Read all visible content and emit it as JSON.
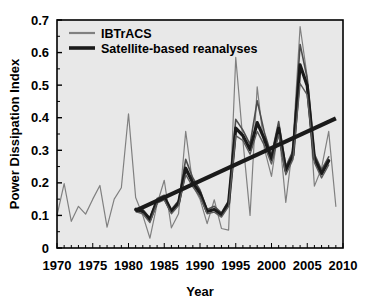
{
  "chart_data": {
    "type": "line",
    "title": "",
    "xlabel": "Year",
    "ylabel": "Power Dissipation Index",
    "xlim": [
      1970,
      2010
    ],
    "ylim": [
      0,
      0.7
    ],
    "xticks": [
      1970,
      1975,
      1980,
      1985,
      1990,
      1995,
      2000,
      2005,
      2010
    ],
    "xticklabels": [
      "1970",
      "1975",
      "1980",
      "1985",
      "1990",
      "1995",
      "2000",
      "2005",
      "2010"
    ],
    "yticks": [
      0,
      0.1,
      0.2,
      0.3,
      0.4,
      0.5,
      0.6,
      0.7
    ],
    "yticklabels": [
      "0",
      "0.1",
      "0.2",
      "0.3",
      "0.4",
      "0.5",
      "0.6",
      "0.7"
    ],
    "minor_xtick_interval": 1,
    "grid": false,
    "plot_background": "#e8e8e8",
    "legend": {
      "position": "top-left",
      "entries": [
        {
          "name": "IBTrACS",
          "color": "#808080",
          "linewidth": 1.2
        },
        {
          "name": "Satellite-based reanalyses",
          "color": "#1a1a1a",
          "linewidth": 3.2
        }
      ]
    },
    "series": [
      {
        "name": "IBTrACS",
        "color": "#808080",
        "linewidth": 1.2,
        "x": [
          1970,
          1971,
          1972,
          1973,
          1974,
          1975,
          1976,
          1977,
          1978,
          1979,
          1980,
          1981,
          1982,
          1983,
          1984,
          1985,
          1986,
          1987,
          1988,
          1989,
          1990,
          1991,
          1992,
          1993,
          1994,
          1995,
          1996,
          1997,
          1998,
          1999,
          2000,
          2001,
          2002,
          2003,
          2004,
          2005,
          2006,
          2007,
          2008,
          2009
        ],
        "y": [
          0.1,
          0.198,
          0.082,
          0.128,
          0.104,
          0.15,
          0.192,
          0.064,
          0.15,
          0.185,
          0.412,
          0.155,
          0.1,
          0.03,
          0.135,
          0.208,
          0.062,
          0.105,
          0.358,
          0.192,
          0.15,
          0.075,
          0.148,
          0.06,
          0.055,
          0.585,
          0.33,
          0.1,
          0.495,
          0.305,
          0.22,
          0.368,
          0.14,
          0.32,
          0.68,
          0.525,
          0.19,
          0.245,
          0.358,
          0.128
        ]
      },
      {
        "name": "Satellite-based reanalyses (member 1)",
        "color": "#4d4d4d",
        "linewidth": 1.6,
        "x": [
          1981,
          1982,
          1983,
          1984,
          1985,
          1986,
          1987,
          1988,
          1989,
          1990,
          1991,
          1992,
          1993,
          1994,
          1995,
          1996,
          1997,
          1998,
          1999,
          2000,
          2001,
          2002,
          2003,
          2004,
          2005,
          2006,
          2007,
          2008
        ],
        "y": [
          0.122,
          0.118,
          0.092,
          0.152,
          0.162,
          0.118,
          0.145,
          0.272,
          0.215,
          0.178,
          0.118,
          0.128,
          0.108,
          0.145,
          0.395,
          0.362,
          0.318,
          0.452,
          0.355,
          0.285,
          0.388,
          0.25,
          0.298,
          0.625,
          0.52,
          0.288,
          0.24,
          0.28
        ]
      },
      {
        "name": "Satellite-based reanalyses (ensemble mean)",
        "color": "#1a1a1a",
        "linewidth": 3.2,
        "x": [
          1981,
          1982,
          1983,
          1984,
          1985,
          1986,
          1987,
          1988,
          1989,
          1990,
          1991,
          1992,
          1993,
          1994,
          1995,
          1996,
          1997,
          1998,
          1999,
          2000,
          2001,
          2002,
          2003,
          2004,
          2005,
          2006,
          2007,
          2008
        ],
        "y": [
          0.118,
          0.112,
          0.088,
          0.145,
          0.155,
          0.112,
          0.138,
          0.245,
          0.2,
          0.168,
          0.112,
          0.118,
          0.102,
          0.138,
          0.368,
          0.345,
          0.302,
          0.385,
          0.335,
          0.272,
          0.368,
          0.238,
          0.285,
          0.562,
          0.498,
          0.275,
          0.228,
          0.268
        ]
      },
      {
        "name": "Satellite-based reanalyses (member 2)",
        "color": "#5a5a5a",
        "linewidth": 1.4,
        "x": [
          1981,
          1982,
          1983,
          1984,
          1985,
          1986,
          1987,
          1988,
          1989,
          1990,
          1991,
          1992,
          1993,
          1994,
          1995,
          1996,
          1997,
          1998,
          1999,
          2000,
          2001,
          2002,
          2003,
          2004,
          2005,
          2006,
          2007,
          2008
        ],
        "y": [
          0.112,
          0.105,
          0.078,
          0.138,
          0.148,
          0.105,
          0.13,
          0.225,
          0.188,
          0.158,
          0.105,
          0.11,
          0.095,
          0.128,
          0.345,
          0.33,
          0.288,
          0.358,
          0.315,
          0.258,
          0.348,
          0.225,
          0.272,
          0.505,
          0.47,
          0.262,
          0.215,
          0.255
        ]
      }
    ],
    "trendline": {
      "name": "linear trend",
      "color": "#1a1a1a",
      "linewidth": 4.2,
      "x": [
        1981,
        2009
      ],
      "y": [
        0.115,
        0.398
      ]
    }
  },
  "axes": {
    "ylabel": "Power Dissipation Index",
    "xlabel": "Year"
  }
}
